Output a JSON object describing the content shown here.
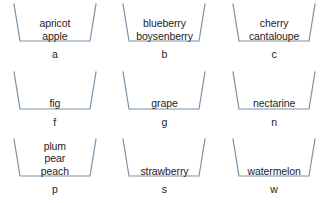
{
  "diagram": {
    "type": "bucket-grid",
    "columns": 3,
    "rows": 3,
    "stroke_color": "#7b93a8",
    "text_color": "#1d1d1d",
    "background_color": "#ffffff",
    "buckets": [
      {
        "key": "a",
        "items": [
          "apricot",
          "apple"
        ]
      },
      {
        "key": "b",
        "items": [
          "blueberry",
          "boysenberry"
        ]
      },
      {
        "key": "c",
        "items": [
          "cherry",
          "cantaloupe"
        ]
      },
      {
        "key": "f",
        "items": [
          "fig"
        ]
      },
      {
        "key": "g",
        "items": [
          "grape"
        ]
      },
      {
        "key": "n",
        "items": [
          "nectarine"
        ]
      },
      {
        "key": "p",
        "items": [
          "plum",
          "pear",
          "peach"
        ]
      },
      {
        "key": "s",
        "items": [
          "strawberry"
        ]
      },
      {
        "key": "w",
        "items": [
          "watermelon"
        ]
      }
    ]
  }
}
